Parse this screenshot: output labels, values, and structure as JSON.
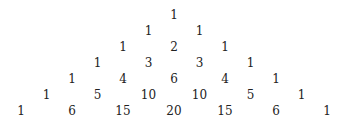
{
  "rows": [
    [
      1
    ],
    [
      1,
      1
    ],
    [
      1,
      2,
      1
    ],
    [
      1,
      3,
      3,
      1
    ],
    [
      1,
      4,
      6,
      4,
      1
    ],
    [
      1,
      5,
      10,
      10,
      5,
      1
    ],
    [
      1,
      6,
      15,
      20,
      15,
      6,
      1
    ]
  ]
}
